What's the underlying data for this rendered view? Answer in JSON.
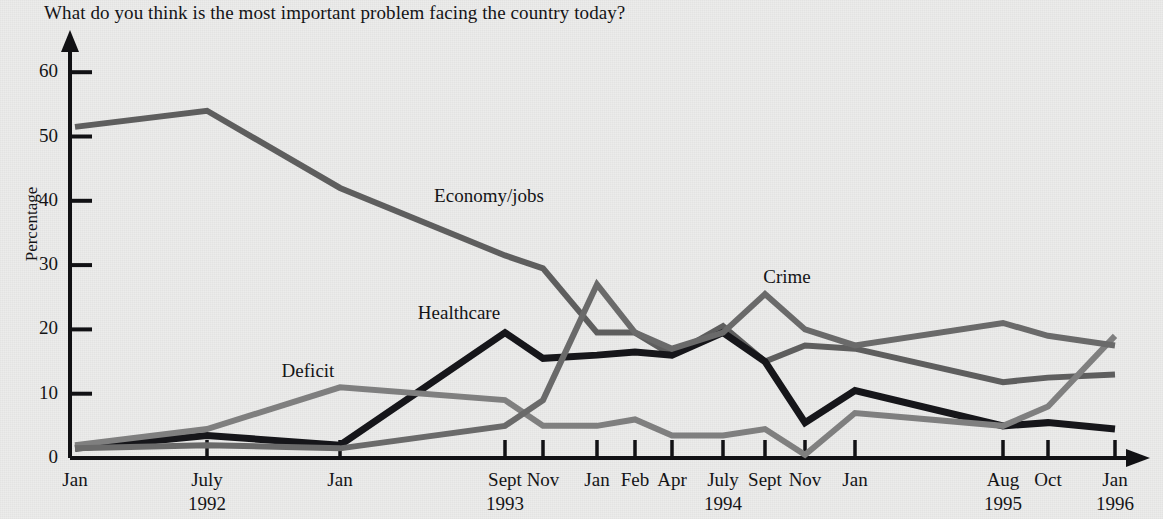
{
  "title": "What do you think is the most important problem facing the country today?",
  "axis": {
    "ylabel": "Percentage",
    "yticks": [
      "0",
      "10",
      "20",
      "30",
      "40",
      "50",
      "60"
    ]
  },
  "xlabels": [
    {
      "month": "Jan",
      "year": ""
    },
    {
      "month": "July",
      "year": "1992"
    },
    {
      "month": "Jan",
      "year": ""
    },
    {
      "month": "Sept",
      "year": ""
    },
    {
      "month": "Nov",
      "year": ""
    },
    {
      "month": "Jan",
      "year": ""
    },
    {
      "month": "Feb",
      "year": ""
    },
    {
      "month": "Apr",
      "year": ""
    },
    {
      "month": "July",
      "year": ""
    },
    {
      "month": "Sept",
      "year": ""
    },
    {
      "month": "Nov",
      "year": ""
    },
    {
      "month": "Jan",
      "year": ""
    },
    {
      "month": "Aug",
      "year": ""
    },
    {
      "month": "Oct",
      "year": ""
    },
    {
      "month": "Jan",
      "year": "1996"
    }
  ],
  "year_labels": [
    {
      "text": "1992"
    },
    {
      "text": "1993"
    },
    {
      "text": "1994"
    },
    {
      "text": "1995"
    },
    {
      "text": "1996"
    }
  ],
  "series_labels": [
    {
      "text": "Economy/jobs"
    },
    {
      "text": "Healthcare"
    },
    {
      "text": "Deficit"
    },
    {
      "text": "Crime"
    }
  ],
  "colors": {
    "economy": "#5e5e5e",
    "healthcare": "#16161a",
    "deficit": "#7f7f7f",
    "crime": "#6a6a6a",
    "axis": "#111114",
    "paper": "#ececeb"
  },
  "chart_data": {
    "type": "line",
    "title": "What do you think is the most important problem facing the country today?",
    "xlabel": "",
    "ylabel": "Percentage",
    "ylim": [
      0,
      65
    ],
    "grid": false,
    "legend": "inline-annotations",
    "categories": [
      "Jan 1992",
      "July 1992",
      "Jan 1993",
      "Sept 1993",
      "Nov 1993",
      "Jan 1994",
      "Feb 1994",
      "Apr 1994",
      "July 1994",
      "Sept 1994",
      "Nov 1994",
      "Jan 1995",
      "Aug 1995",
      "Oct 1995",
      "Jan 1996"
    ],
    "series": [
      {
        "name": "Economy/jobs",
        "color": "#5e5e5e",
        "values": [
          51.5,
          54,
          42,
          31.5,
          29.5,
          19.5,
          19.5,
          16,
          20.5,
          15,
          17.5,
          17,
          11.8,
          12.5,
          13
        ]
      },
      {
        "name": "Healthcare",
        "color": "#16161a",
        "values": [
          1.5,
          3.5,
          2,
          19.5,
          15.5,
          16,
          16.5,
          16,
          19.5,
          15,
          5.5,
          10.5,
          5,
          5.5,
          4.5
        ]
      },
      {
        "name": "Deficit",
        "color": "#7f7f7f",
        "values": [
          2,
          4.5,
          11,
          9,
          5,
          5,
          6,
          3.5,
          3.5,
          4.5,
          0.5,
          7,
          5,
          8,
          19
        ]
      },
      {
        "name": "Crime",
        "color": "#6a6a6a",
        "values": [
          1.5,
          2,
          1.5,
          5,
          9,
          27,
          19.5,
          17,
          19.5,
          25.5,
          20,
          17.5,
          21,
          19,
          17.5
        ]
      }
    ]
  }
}
